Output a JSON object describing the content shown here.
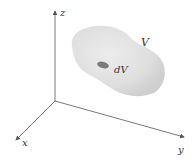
{
  "diagram": {
    "axes": {
      "x_label": "x",
      "y_label": "y",
      "z_label": "z"
    },
    "region_label": "V",
    "element_label": "dV",
    "colors": {
      "axis": "#555555",
      "region_fill": "#dcdcdc",
      "region_shade": "#c8c8c8",
      "element_fill": "#7a7a7a",
      "text": "#333333"
    }
  }
}
